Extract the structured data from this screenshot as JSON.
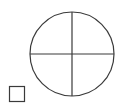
{
  "diagram": {
    "stroke_color": "#3a3a3a",
    "background": "#ffffff",
    "circle": {
      "cx": 72,
      "cy": 54,
      "r": 42,
      "stroke_width": 1.2
    },
    "crosshair": {
      "vertical": {
        "x": 72,
        "y1": 12,
        "y2": 96
      },
      "horizontal": {
        "y": 54,
        "x1": 30,
        "x2": 114
      }
    },
    "square": {
      "x": 9.5,
      "y": 86.5,
      "width": 15,
      "height": 15,
      "stroke_width": 1.2
    }
  }
}
